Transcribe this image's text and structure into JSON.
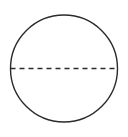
{
  "figure": {
    "background_color": "#ffffff",
    "width": 128,
    "height": 137,
    "shapes": {
      "circle": {
        "name": "circle-outline",
        "center_x": 64,
        "center_y": 68.5,
        "radius": 53.5,
        "stroke_color": "#2b2b2b",
        "stroke_width": 1.4,
        "fill": "none"
      },
      "diameter": {
        "name": "dashed-diameter-line",
        "x1": 10.5,
        "y1": 68.5,
        "x2": 117.5,
        "y2": 68.5,
        "stroke_color": "#2b2b2b",
        "stroke_width": 1.3,
        "dash_length": 5,
        "gap_length": 4,
        "label": ""
      }
    }
  }
}
